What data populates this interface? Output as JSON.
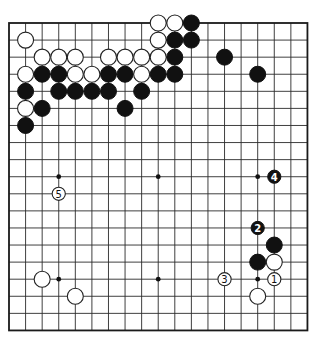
{
  "board": {
    "size": 19,
    "origin_x": 9,
    "origin_y": 23,
    "spacing_x": 16.58,
    "spacing_y": 17.08,
    "stone_radius": 8,
    "numbered_radius": 6.6,
    "colors": {
      "line": "#2a2a2a",
      "black": "#111111",
      "white": "#ffffff",
      "background": "#ffffff"
    }
  },
  "star_points": [
    {
      "col": 3,
      "row": 9
    },
    {
      "col": 9,
      "row": 9
    },
    {
      "col": 15,
      "row": 9
    },
    {
      "col": 3,
      "row": 15
    },
    {
      "col": 9,
      "row": 15
    },
    {
      "col": 15,
      "row": 15
    }
  ],
  "stones": [
    {
      "color": "white",
      "col": 9,
      "row": 0
    },
    {
      "color": "white",
      "col": 10,
      "row": 0
    },
    {
      "color": "black",
      "col": 11,
      "row": 0
    },
    {
      "color": "white",
      "col": 1,
      "row": 1
    },
    {
      "color": "white",
      "col": 9,
      "row": 1
    },
    {
      "color": "black",
      "col": 10,
      "row": 1
    },
    {
      "color": "black",
      "col": 11,
      "row": 1
    },
    {
      "color": "white",
      "col": 2,
      "row": 2
    },
    {
      "color": "white",
      "col": 3,
      "row": 2
    },
    {
      "color": "white",
      "col": 4,
      "row": 2
    },
    {
      "color": "white",
      "col": 6,
      "row": 2
    },
    {
      "color": "white",
      "col": 7,
      "row": 2
    },
    {
      "color": "white",
      "col": 8,
      "row": 2
    },
    {
      "color": "white",
      "col": 9,
      "row": 2
    },
    {
      "color": "black",
      "col": 10,
      "row": 2
    },
    {
      "color": "black",
      "col": 13,
      "row": 2
    },
    {
      "color": "white",
      "col": 1,
      "row": 3
    },
    {
      "color": "black",
      "col": 2,
      "row": 3
    },
    {
      "color": "black",
      "col": 3,
      "row": 3
    },
    {
      "color": "white",
      "col": 4,
      "row": 3
    },
    {
      "color": "white",
      "col": 5,
      "row": 3
    },
    {
      "color": "black",
      "col": 6,
      "row": 3
    },
    {
      "color": "black",
      "col": 7,
      "row": 3
    },
    {
      "color": "white",
      "col": 8,
      "row": 3
    },
    {
      "color": "black",
      "col": 9,
      "row": 3
    },
    {
      "color": "black",
      "col": 10,
      "row": 3
    },
    {
      "color": "black",
      "col": 15,
      "row": 3
    },
    {
      "color": "black",
      "col": 1,
      "row": 4
    },
    {
      "color": "black",
      "col": 3,
      "row": 4
    },
    {
      "color": "black",
      "col": 4,
      "row": 4
    },
    {
      "color": "black",
      "col": 5,
      "row": 4
    },
    {
      "color": "black",
      "col": 6,
      "row": 4
    },
    {
      "color": "black",
      "col": 8,
      "row": 4
    },
    {
      "color": "white",
      "col": 1,
      "row": 5
    },
    {
      "color": "black",
      "col": 2,
      "row": 5
    },
    {
      "color": "black",
      "col": 7,
      "row": 5
    },
    {
      "color": "black",
      "col": 1,
      "row": 6
    },
    {
      "color": "black",
      "col": 16,
      "row": 13
    },
    {
      "color": "black",
      "col": 15,
      "row": 14
    },
    {
      "color": "white",
      "col": 16,
      "row": 14
    },
    {
      "color": "white",
      "col": 2,
      "row": 15
    },
    {
      "color": "white",
      "col": 4,
      "row": 16
    },
    {
      "color": "white",
      "col": 15,
      "row": 16
    }
  ],
  "moves": [
    {
      "number": "1",
      "color": "white",
      "col": 16,
      "row": 15
    },
    {
      "number": "2",
      "color": "black",
      "col": 15,
      "row": 12
    },
    {
      "number": "3",
      "color": "white",
      "col": 13,
      "row": 15
    },
    {
      "number": "4",
      "color": "black",
      "col": 16,
      "row": 9
    },
    {
      "number": "5",
      "color": "white",
      "col": 3,
      "row": 10
    }
  ]
}
